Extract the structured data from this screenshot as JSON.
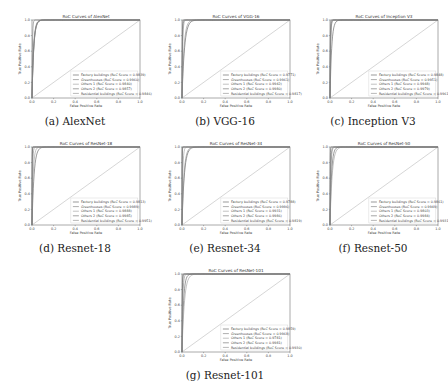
{
  "figure": {
    "xlabel": "False Positive Rate",
    "ylabel": "True Positive Rate",
    "xticks": [
      "0.0",
      "0.2",
      "0.4",
      "0.6",
      "0.8",
      "1.0"
    ],
    "yticks": [
      "0.0",
      "0.2",
      "0.4",
      "0.6",
      "0.8",
      "1.0"
    ],
    "series_names": [
      "Factory buildings",
      "Greenhouses",
      "Others 1",
      "Others 2",
      "Residential buildings"
    ],
    "diagonal_color": "#bbbbbb",
    "curve_colors": [
      "#555555",
      "#777777",
      "#999999",
      "#666666",
      "#888888"
    ]
  },
  "chart_data": [
    {
      "type": "line",
      "caption": "(a) AlexNet",
      "title": "RoC Curves of AlexNet",
      "xlabel": "False Positive Rate",
      "ylabel": "True Positive Rate",
      "xlim": [
        0,
        1
      ],
      "ylim": [
        0,
        1
      ],
      "legend_position": "lower-right",
      "series": [
        {
          "name": "Factory buildings",
          "label": "Factory buildings (RoC Score = 0.9839)",
          "auc": 0.9839
        },
        {
          "name": "Greenhouses",
          "label": "Greenhouses (RoC Score = 0.9960)",
          "auc": 0.996
        },
        {
          "name": "Others 1",
          "label": "Others 1 (RoC Score = 0.9840)",
          "auc": 0.984
        },
        {
          "name": "Others 2",
          "label": "Others 2 (RoC Score = 0.9857)",
          "auc": 0.9857
        },
        {
          "name": "Residential buildings",
          "label": "Residential buildings (RoC Score = 0.9846)",
          "auc": 0.9846
        }
      ]
    },
    {
      "type": "line",
      "caption": "(b) VGG-16",
      "title": "RoC Curves of VGG-16",
      "xlabel": "False Positive Rate",
      "ylabel": "True Positive Rate",
      "xlim": [
        0,
        1
      ],
      "ylim": [
        0,
        1
      ],
      "legend_position": "lower-right",
      "series": [
        {
          "name": "Factory buildings",
          "label": "Factory buildings (RoC Score = 0.9771)",
          "auc": 0.9771
        },
        {
          "name": "Greenhouses",
          "label": "Greenhouses (RoC Score = 0.9961)",
          "auc": 0.9961
        },
        {
          "name": "Others 1",
          "label": "Others 1 (RoC Score = 0.9942)",
          "auc": 0.9942
        },
        {
          "name": "Others 2",
          "label": "Others 2 (RoC Score = 0.9980)",
          "auc": 0.998
        },
        {
          "name": "Residential buildings",
          "label": "Residential buildings (RoC Score = 0.9817)",
          "auc": 0.9817
        }
      ]
    },
    {
      "type": "line",
      "caption": "(c) Inception V3",
      "title": "RoC Curves of Inception V3",
      "xlabel": "False Positive Rate",
      "ylabel": "True Positive Rate",
      "xlim": [
        0,
        1
      ],
      "ylim": [
        0,
        1
      ],
      "legend_position": "lower-right",
      "series": [
        {
          "name": "Factory buildings",
          "label": "Factory buildings (RoC Score = 0.9848)",
          "auc": 0.9848
        },
        {
          "name": "Greenhouses",
          "label": "Greenhouses (RoC Score = 0.9951)",
          "auc": 0.9951
        },
        {
          "name": "Others 1",
          "label": "Others 1 (RoC Score = 0.9948)",
          "auc": 0.9948
        },
        {
          "name": "Others 2",
          "label": "Others 2 (RoC Score = 0.9979)",
          "auc": 0.9979
        },
        {
          "name": "Residential buildings",
          "label": "Residential buildings (RoC Score = 0.9961)",
          "auc": 0.9961
        }
      ]
    },
    {
      "type": "line",
      "caption": "(d) Resnet-18",
      "title": "RoC Curves of ResNet-18",
      "xlabel": "False Positive Rate",
      "ylabel": "True Positive Rate",
      "xlim": [
        0,
        1
      ],
      "ylim": [
        0,
        1
      ],
      "legend_position": "lower-right",
      "series": [
        {
          "name": "Factory buildings",
          "label": "Factory buildings (RoC Score = 0.9813)",
          "auc": 0.9813
        },
        {
          "name": "Greenhouses",
          "label": "Greenhouses (RoC Score = 0.9989)",
          "auc": 0.9989
        },
        {
          "name": "Others 1",
          "label": "Others 1 (RoC Score = 0.9888)",
          "auc": 0.9888
        },
        {
          "name": "Others 2",
          "label": "Others 2 (RoC Score = 0.9985)",
          "auc": 0.9985
        },
        {
          "name": "Residential buildings",
          "label": "Residential buildings (RoC Score = 0.9951)",
          "auc": 0.9951
        }
      ]
    },
    {
      "type": "line",
      "caption": "(e) Resnet-34",
      "title": "RoC Curves of ResNet-34",
      "xlabel": "False Positive Rate",
      "ylabel": "True Positive Rate",
      "xlim": [
        0,
        1
      ],
      "ylim": [
        0,
        1
      ],
      "legend_position": "lower-right",
      "series": [
        {
          "name": "Factory buildings",
          "label": "Factory buildings (RoC Score = 0.9788)",
          "auc": 0.9788
        },
        {
          "name": "Greenhouses",
          "label": "Greenhouses (RoC Score = 0.9996)",
          "auc": 0.9996
        },
        {
          "name": "Others 1",
          "label": "Others 1 (RoC Score = 0.9931)",
          "auc": 0.9931
        },
        {
          "name": "Others 2",
          "label": "Others 2 (RoC Score = 0.9986)",
          "auc": 0.9986
        },
        {
          "name": "Residential buildings",
          "label": "Residential buildings (RoC Score = 0.9819)",
          "auc": 0.9819
        }
      ]
    },
    {
      "type": "line",
      "caption": "(f) Resnet-50",
      "title": "RoC Curves of ResNet-50",
      "xlabel": "False Positive Rate",
      "ylabel": "True Positive Rate",
      "xlim": [
        0,
        1
      ],
      "ylim": [
        0,
        1
      ],
      "legend_position": "lower-right",
      "series": [
        {
          "name": "Factory buildings",
          "label": "Factory buildings (RoC Score = 0.9861)",
          "auc": 0.9861
        },
        {
          "name": "Greenhouses",
          "label": "Greenhouses (RoC Score = 0.9949)",
          "auc": 0.9949
        },
        {
          "name": "Others 1",
          "label": "Others 1 (RoC Score = 0.9803)",
          "auc": 0.9803
        },
        {
          "name": "Others 2",
          "label": "Others 2 (RoC Score = 0.9984)",
          "auc": 0.9984
        },
        {
          "name": "Residential buildings",
          "label": "Residential buildings (RoC Score = 0.9931)",
          "auc": 0.9931
        }
      ]
    },
    {
      "type": "line",
      "caption": "(g) Resnet-101",
      "title": "RoC Curves of ResNet-101",
      "xlabel": "False Positive Rate",
      "ylabel": "True Positive Rate",
      "xlim": [
        0,
        1
      ],
      "ylim": [
        0,
        1
      ],
      "legend_position": "lower-right",
      "series": [
        {
          "name": "Factory buildings",
          "label": "Factory buildings (RoC Score = 0.9859)",
          "auc": 0.9859
        },
        {
          "name": "Greenhouses",
          "label": "Greenhouses (RoC Score = 0.9968)",
          "auc": 0.9968
        },
        {
          "name": "Others 1",
          "label": "Others 1 (RoC Score = 0.9781)",
          "auc": 0.9781
        },
        {
          "name": "Others 2",
          "label": "Others 2 (RoC Score = 0.9981)",
          "auc": 0.9981
        },
        {
          "name": "Residential buildings",
          "label": "Residential buildings (RoC Score = 0.9930)",
          "auc": 0.993
        }
      ]
    }
  ]
}
